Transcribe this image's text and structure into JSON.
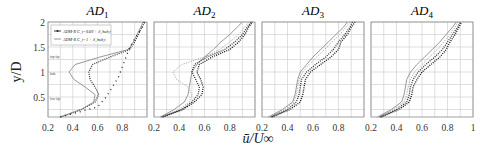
{
  "chart_data": {
    "type": "line",
    "xlabel": "ū/U∞",
    "ylabel": "y/D",
    "xlim": [
      0.2,
      1.0
    ],
    "ylim": [
      0.1,
      2.0
    ],
    "xticks": [
      "0.2",
      "0.4",
      "0.6",
      "0.8"
    ],
    "xticks_last_panel": [
      "0.2",
      "0.4",
      "0.6",
      "0.8",
      "1"
    ],
    "yticks": [
      "0.5",
      "1",
      "1.5",
      "2"
    ],
    "grid": true,
    "legend": {
      "position": "upper-left of first panel",
      "entries": [
        {
          "label": "ADM-R C_t=0.89 + δ_hub,t",
          "marker": "solid dot line"
        },
        {
          "label": "ADM-R C_t=1 + δ_hub,t",
          "marker": "dashed line"
        }
      ]
    },
    "annotations": [
      {
        "panel": "AD1",
        "text": "top tip",
        "y": 1.35
      },
      {
        "panel": "AD1",
        "text": "hub",
        "y": 1.0
      },
      {
        "panel": "AD1",
        "text": "low tip",
        "y": 0.5
      }
    ],
    "panels": [
      {
        "title": "AD",
        "subscript": "1",
        "series": [
          {
            "name": "ADM-R C_t=0.89 + δ_hub,t",
            "style": "dotted-dark",
            "y": [
              0.1,
              0.25,
              0.4,
              0.55,
              0.7,
              0.85,
              1.0,
              1.15,
              1.3,
              1.45,
              1.6,
              1.75,
              1.9,
              2.0
            ],
            "x": [
              0.3,
              0.47,
              0.58,
              0.61,
              0.58,
              0.54,
              0.53,
              0.56,
              0.7,
              0.86,
              0.9,
              0.93,
              0.96,
              0.98
            ]
          },
          {
            "name": "ADM-R C_t=1 + δ_hub,t",
            "style": "solid-gray",
            "y": [
              0.1,
              0.25,
              0.4,
              0.55,
              0.7,
              0.85,
              1.0,
              1.15,
              1.3,
              1.45,
              1.6,
              1.75,
              1.9,
              2.0
            ],
            "x": [
              0.3,
              0.47,
              0.57,
              0.58,
              0.5,
              0.41,
              0.37,
              0.42,
              0.62,
              0.85,
              0.89,
              0.92,
              0.95,
              0.97
            ]
          },
          {
            "name": "inflow",
            "style": "sparse-cross",
            "y": [
              0.1,
              0.3,
              0.5,
              0.7,
              0.9,
              1.1,
              1.3,
              1.5,
              1.7,
              1.9,
              2.0
            ],
            "x": [
              0.3,
              0.6,
              0.67,
              0.72,
              0.77,
              0.8,
              0.83,
              0.86,
              0.91,
              0.96,
              0.98
            ]
          }
        ]
      },
      {
        "title": "AD",
        "subscript": "2",
        "series": [
          {
            "name": "s1",
            "style": "solid-gray",
            "y": [
              0.1,
              0.25,
              0.4,
              0.55,
              0.7,
              0.85,
              1.0,
              1.15,
              1.3,
              1.45,
              1.6,
              1.75,
              1.9,
              2.0
            ],
            "x": [
              0.25,
              0.36,
              0.44,
              0.47,
              0.48,
              0.49,
              0.5,
              0.54,
              0.6,
              0.67,
              0.73,
              0.8,
              0.86,
              0.9
            ]
          },
          {
            "name": "s2",
            "style": "dotted-light",
            "y": [
              0.1,
              0.25,
              0.4,
              0.55,
              0.7,
              0.85,
              1.0,
              1.15,
              1.3,
              1.45,
              1.6,
              1.75,
              1.9,
              2.0
            ],
            "x": [
              0.25,
              0.4,
              0.48,
              0.5,
              0.47,
              0.38,
              0.35,
              0.42,
              0.6,
              0.72,
              0.8,
              0.87,
              0.92,
              0.95
            ]
          },
          {
            "name": "s3",
            "style": "dotted-dark",
            "y": [
              0.1,
              0.25,
              0.4,
              0.55,
              0.7,
              0.85,
              1.0,
              1.15,
              1.3,
              1.45,
              1.6,
              1.75,
              1.9,
              2.0
            ],
            "x": [
              0.26,
              0.42,
              0.5,
              0.55,
              0.56,
              0.53,
              0.5,
              0.52,
              0.62,
              0.76,
              0.84,
              0.9,
              0.94,
              0.97
            ]
          },
          {
            "name": "s4",
            "style": "dotted-black",
            "y": [
              0.1,
              0.25,
              0.4,
              0.55,
              0.7,
              0.85,
              1.0,
              1.15,
              1.3,
              1.45,
              1.6,
              1.75,
              1.9,
              2.0
            ],
            "x": [
              0.27,
              0.43,
              0.52,
              0.58,
              0.59,
              0.57,
              0.54,
              0.56,
              0.66,
              0.8,
              0.87,
              0.92,
              0.95,
              0.98
            ]
          }
        ]
      },
      {
        "title": "AD",
        "subscript": "3",
        "series": [
          {
            "name": "s1",
            "style": "solid-gray",
            "y": [
              0.1,
              0.25,
              0.4,
              0.55,
              0.7,
              0.85,
              1.0,
              1.15,
              1.3,
              1.45,
              1.6,
              1.75,
              1.9,
              2.0
            ],
            "x": [
              0.25,
              0.36,
              0.44,
              0.46,
              0.47,
              0.48,
              0.5,
              0.55,
              0.6,
              0.66,
              0.72,
              0.78,
              0.84,
              0.87
            ]
          },
          {
            "name": "s2",
            "style": "dotted-light",
            "y": [
              0.1,
              0.25,
              0.4,
              0.55,
              0.7,
              0.85,
              1.0,
              1.15,
              1.3,
              1.45,
              1.6,
              1.75,
              1.9,
              2.0
            ],
            "x": [
              0.26,
              0.38,
              0.45,
              0.47,
              0.48,
              0.49,
              0.52,
              0.57,
              0.63,
              0.69,
              0.75,
              0.81,
              0.86,
              0.89
            ]
          },
          {
            "name": "s3",
            "style": "dotted-dark",
            "y": [
              0.1,
              0.25,
              0.4,
              0.55,
              0.7,
              0.85,
              1.0,
              1.15,
              1.3,
              1.45,
              1.6,
              1.75,
              1.9,
              2.0
            ],
            "x": [
              0.27,
              0.4,
              0.47,
              0.49,
              0.5,
              0.51,
              0.55,
              0.62,
              0.7,
              0.76,
              0.8,
              0.85,
              0.89,
              0.91
            ]
          },
          {
            "name": "s4",
            "style": "dotted-black",
            "y": [
              0.1,
              0.25,
              0.4,
              0.55,
              0.7,
              0.85,
              1.0,
              1.15,
              1.3,
              1.45,
              1.6,
              1.75,
              1.9,
              2.0
            ],
            "x": [
              0.28,
              0.42,
              0.5,
              0.52,
              0.53,
              0.54,
              0.58,
              0.66,
              0.74,
              0.8,
              0.82,
              0.87,
              0.9,
              0.93
            ]
          }
        ]
      },
      {
        "title": "AD",
        "subscript": "4",
        "series": [
          {
            "name": "s1",
            "style": "solid-gray",
            "y": [
              0.1,
              0.25,
              0.4,
              0.55,
              0.7,
              0.85,
              1.0,
              1.15,
              1.3,
              1.45,
              1.6,
              1.75,
              1.9,
              2.0
            ],
            "x": [
              0.25,
              0.36,
              0.44,
              0.46,
              0.47,
              0.48,
              0.51,
              0.56,
              0.62,
              0.68,
              0.74,
              0.79,
              0.84,
              0.87
            ]
          },
          {
            "name": "s2",
            "style": "dotted-light",
            "y": [
              0.1,
              0.25,
              0.4,
              0.55,
              0.7,
              0.85,
              1.0,
              1.15,
              1.3,
              1.45,
              1.6,
              1.75,
              1.9,
              2.0
            ],
            "x": [
              0.26,
              0.38,
              0.46,
              0.48,
              0.49,
              0.51,
              0.54,
              0.6,
              0.66,
              0.72,
              0.77,
              0.82,
              0.86,
              0.88
            ]
          },
          {
            "name": "s3",
            "style": "dotted-dark",
            "y": [
              0.1,
              0.25,
              0.4,
              0.55,
              0.7,
              0.85,
              1.0,
              1.15,
              1.3,
              1.45,
              1.6,
              1.75,
              1.9,
              2.0
            ],
            "x": [
              0.27,
              0.4,
              0.48,
              0.5,
              0.51,
              0.53,
              0.57,
              0.63,
              0.7,
              0.76,
              0.8,
              0.84,
              0.88,
              0.9
            ]
          },
          {
            "name": "s4",
            "style": "dotted-black",
            "y": [
              0.1,
              0.25,
              0.4,
              0.55,
              0.7,
              0.85,
              1.0,
              1.15,
              1.3,
              1.45,
              1.6,
              1.75,
              1.9,
              2.0
            ],
            "x": [
              0.28,
              0.42,
              0.5,
              0.52,
              0.53,
              0.56,
              0.6,
              0.67,
              0.74,
              0.79,
              0.82,
              0.86,
              0.89,
              0.91
            ]
          }
        ]
      }
    ]
  },
  "colors": {
    "grid": "#c9c9c9",
    "frame": "#8a8a8a",
    "solid-gray": "#8c8c8c",
    "dotted-light": "#9a9a9a",
    "dotted-dark": "#333333",
    "dotted-black": "#111111",
    "sparse-cross": "#222222"
  }
}
